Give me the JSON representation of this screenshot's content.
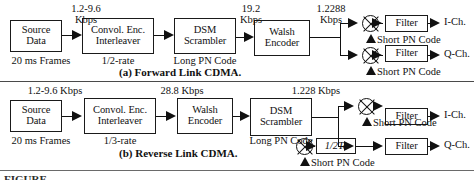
{
  "figure": {
    "title_partial": "FIGURE",
    "captions": {
      "forward": "(a) Forward Link CDMA.",
      "reverse": "(b) Reverse Link CDMA."
    }
  },
  "forward_link": {
    "blocks": [
      {
        "name": "source-data",
        "line1": "Source",
        "line2": "Data"
      },
      {
        "name": "convolutional-encoder-interleaver",
        "line1": "Convol. Enc.",
        "line2": "Interleaver"
      },
      {
        "name": "dsm-scrambler",
        "line1": "DSM",
        "line2": "Scrambler"
      },
      {
        "name": "walsh-encoder",
        "line1": "Walsh",
        "line2": "Encoder"
      },
      {
        "name": "filter-i",
        "line1": "Filter"
      },
      {
        "name": "filter-q",
        "line1": "Filter"
      }
    ],
    "under_labels": [
      {
        "name": "source-data-note",
        "text": "20 ms Frames"
      },
      {
        "name": "coding-rate-note",
        "text": "1/2-rate"
      },
      {
        "name": "long-pn-code-note",
        "text": "Long PN Code"
      }
    ],
    "rate_labels": [
      {
        "name": "rate-source",
        "line1": "1.2-9.6",
        "line2": "Kbps"
      },
      {
        "name": "rate-scrambler-out",
        "line1": "19.2",
        "line2": "Kbps"
      },
      {
        "name": "rate-walsh-out",
        "line1": "1.2288",
        "line2": "Kbps"
      }
    ],
    "pn_labels": [
      {
        "name": "short-pn-code-i",
        "text": "Short PN Code"
      },
      {
        "name": "short-pn-code-q",
        "text": "Short PN Code"
      }
    ],
    "outputs": [
      {
        "name": "output-i-channel",
        "text": "I-Ch."
      },
      {
        "name": "output-q-channel",
        "text": "Q-Ch."
      }
    ]
  },
  "reverse_link": {
    "blocks": [
      {
        "name": "source-data",
        "line1": "Source",
        "line2": "Data"
      },
      {
        "name": "convolutional-encoder-interleaver",
        "line1": "Convol. Enc.",
        "line2": "Interleaver"
      },
      {
        "name": "walsh-encoder",
        "line1": "Walsh",
        "line2": "Encoder"
      },
      {
        "name": "dsm-scrambler",
        "line1": "DSM",
        "line2": "Scrambler"
      },
      {
        "name": "half-chip-delay",
        "line1": "1/2Tc"
      },
      {
        "name": "filter-i",
        "line1": "Filter"
      },
      {
        "name": "filter-q",
        "line1": "Filter"
      }
    ],
    "under_labels": [
      {
        "name": "source-data-note",
        "text": "20 ms Frames"
      },
      {
        "name": "coding-rate-note",
        "text": "1/3-rate"
      },
      {
        "name": "long-pn-code-note",
        "text": "Long PN Code"
      }
    ],
    "rate_labels": [
      {
        "name": "rate-source",
        "line1": "1.2-9.6 Kbps"
      },
      {
        "name": "rate-interleaver-out",
        "line1": "28.8 Kbps"
      },
      {
        "name": "rate-scrambler-out",
        "line1": "1.228 Kbps"
      }
    ],
    "pn_labels": [
      {
        "name": "short-pn-code-i",
        "text": "Short PN Code"
      },
      {
        "name": "short-pn-code-q",
        "text": "Short PN Code"
      }
    ],
    "outputs": [
      {
        "name": "output-i-channel",
        "text": "I-Ch."
      },
      {
        "name": "output-q-channel",
        "text": "Q-Ch."
      }
    ]
  }
}
